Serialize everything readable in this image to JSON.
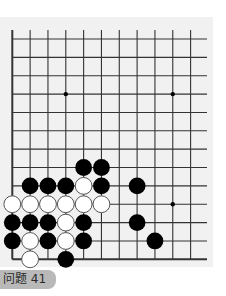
{
  "puzzle": {
    "label": "问题 41",
    "colors": {
      "board_bg": "#f1f1f1",
      "line": "#333333",
      "black_stone": "#000000",
      "white_stone": "#ffffff",
      "tab_bg": "#b9b9b9"
    },
    "grid": {
      "columns": 11,
      "rows": 13,
      "origin_x": 12.3,
      "origin_y": 39,
      "spacing_x": 17.83,
      "spacing_y": 18.36,
      "open_top": true,
      "open_right": true,
      "left_edge": true,
      "bottom_edge": true
    },
    "star_points": [
      {
        "col": 3,
        "row": 3
      },
      {
        "col": 9,
        "row": 3
      },
      {
        "col": 9,
        "row": 9
      }
    ],
    "stones": [
      {
        "color": "black",
        "col": 4,
        "row": 7
      },
      {
        "color": "black",
        "col": 5,
        "row": 7
      },
      {
        "color": "black",
        "col": 1,
        "row": 8
      },
      {
        "color": "black",
        "col": 2,
        "row": 8
      },
      {
        "color": "black",
        "col": 3,
        "row": 8
      },
      {
        "color": "white",
        "col": 4,
        "row": 8
      },
      {
        "color": "black",
        "col": 5,
        "row": 8
      },
      {
        "color": "black",
        "col": 7,
        "row": 8
      },
      {
        "color": "white",
        "col": 0,
        "row": 9
      },
      {
        "color": "white",
        "col": 1,
        "row": 9
      },
      {
        "color": "white",
        "col": 2,
        "row": 9
      },
      {
        "color": "white",
        "col": 3,
        "row": 9
      },
      {
        "color": "white",
        "col": 4,
        "row": 9
      },
      {
        "color": "white",
        "col": 5,
        "row": 9
      },
      {
        "color": "black",
        "col": 0,
        "row": 10
      },
      {
        "color": "black",
        "col": 1,
        "row": 10
      },
      {
        "color": "black",
        "col": 2,
        "row": 10
      },
      {
        "color": "white",
        "col": 3,
        "row": 10
      },
      {
        "color": "black",
        "col": 4,
        "row": 10
      },
      {
        "color": "black",
        "col": 7,
        "row": 10
      },
      {
        "color": "black",
        "col": 0,
        "row": 11
      },
      {
        "color": "white",
        "col": 1,
        "row": 11
      },
      {
        "color": "black",
        "col": 2,
        "row": 11
      },
      {
        "color": "white",
        "col": 3,
        "row": 11
      },
      {
        "color": "black",
        "col": 4,
        "row": 11
      },
      {
        "color": "black",
        "col": 8,
        "row": 11
      },
      {
        "color": "white",
        "col": 1,
        "row": 12
      },
      {
        "color": "black",
        "col": 3,
        "row": 12
      }
    ]
  }
}
